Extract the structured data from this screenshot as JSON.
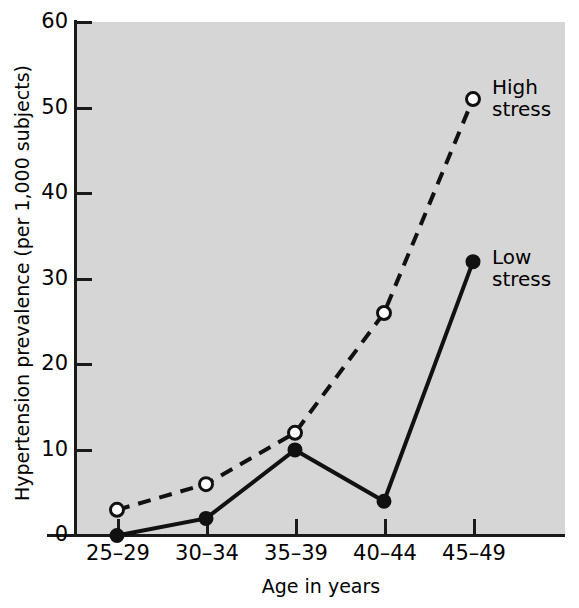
{
  "chart_data": {
    "type": "line",
    "title": "",
    "xlabel": "Age in years",
    "ylabel": "Hypertension prevalence (per 1,000 subjects)",
    "categories": [
      "25–29",
      "30–34",
      "35–39",
      "40–44",
      "45–49"
    ],
    "xticklabels": [
      "25–29",
      "30–34",
      "35–39",
      "40–44",
      "45–49"
    ],
    "yticklabels": [
      "0",
      "10",
      "20",
      "30",
      "40",
      "50",
      "60"
    ],
    "yticks": [
      0,
      10,
      20,
      30,
      40,
      50,
      60
    ],
    "ylim": [
      0,
      60
    ],
    "grid": false,
    "legend_position": "inline-annotation",
    "series": [
      {
        "name": "High stress",
        "label": "High\nstress",
        "values": [
          3,
          6,
          12,
          26,
          51
        ],
        "marker": "open-circle",
        "linestyle": "dashed",
        "color": "#111111"
      },
      {
        "name": "Low stress",
        "label": "Low\nstress",
        "values": [
          0,
          2,
          10,
          4,
          32
        ],
        "marker": "filled-circle",
        "linestyle": "solid",
        "color": "#111111"
      }
    ],
    "colors": {
      "plot_background": "#d6d6d6",
      "figure_background": "#ffffff",
      "axis": "#1a1a1a",
      "line": "#111111",
      "marker_fill_open": "#ffffff",
      "marker_fill_closed": "#111111"
    }
  }
}
